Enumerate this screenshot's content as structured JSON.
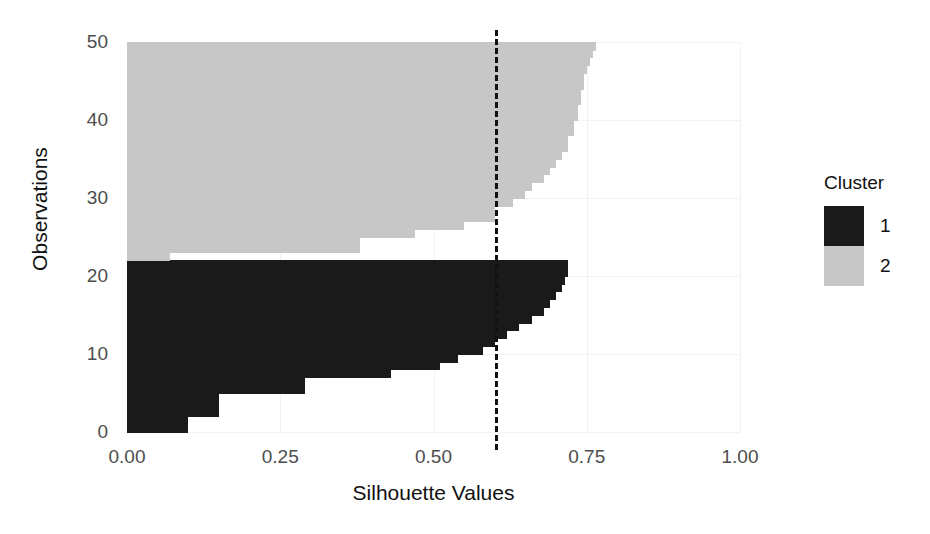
{
  "chart_data": {
    "type": "bar",
    "orientation": "horizontal",
    "title": "",
    "xlabel": "Silhouette Values",
    "ylabel": "Observations",
    "xlim": [
      0,
      1
    ],
    "ylim": [
      0,
      50
    ],
    "xticks": [
      "0.00",
      "0.25",
      "0.50",
      "0.75",
      "1.00"
    ],
    "xtick_values": [
      0,
      0.25,
      0.5,
      0.75,
      1
    ],
    "yticks": [
      "0",
      "10",
      "20",
      "30",
      "40",
      "50"
    ],
    "ytick_values": [
      0,
      10,
      20,
      30,
      40,
      50
    ],
    "grid": true,
    "legend": {
      "title": "Cluster",
      "position": "right",
      "entries": [
        {
          "label": "1",
          "color": "#1a1a1a"
        },
        {
          "label": "2",
          "color": "#c7c7c7"
        }
      ]
    },
    "annotations": [
      {
        "type": "vertical-dashed-line",
        "name": "average-silhouette-width",
        "value": 0.6,
        "color": "#111111"
      }
    ],
    "series": [
      {
        "name": "1",
        "color": "#1a1a1a",
        "observations": [
          1,
          2,
          3,
          4,
          5,
          6,
          7,
          8,
          9,
          10,
          11,
          12,
          13,
          14,
          15,
          16,
          17,
          18,
          19,
          20,
          21,
          22
        ],
        "values": [
          0.1,
          0.1,
          0.15,
          0.15,
          0.15,
          0.29,
          0.29,
          0.43,
          0.51,
          0.54,
          0.58,
          0.6,
          0.62,
          0.64,
          0.66,
          0.68,
          0.69,
          0.7,
          0.71,
          0.715,
          0.72,
          0.72
        ]
      },
      {
        "name": "2",
        "color": "#c7c7c7",
        "observations": [
          23,
          24,
          25,
          26,
          27,
          28,
          29,
          30,
          31,
          32,
          33,
          34,
          35,
          36,
          37,
          38,
          39,
          40,
          41,
          42,
          43,
          44,
          45,
          46,
          47,
          48,
          49,
          50
        ],
        "values": [
          0.07,
          0.38,
          0.38,
          0.47,
          0.55,
          0.6,
          0.6,
          0.63,
          0.65,
          0.66,
          0.68,
          0.69,
          0.7,
          0.71,
          0.72,
          0.72,
          0.73,
          0.73,
          0.735,
          0.735,
          0.74,
          0.74,
          0.745,
          0.745,
          0.75,
          0.755,
          0.76,
          0.765
        ]
      }
    ]
  }
}
